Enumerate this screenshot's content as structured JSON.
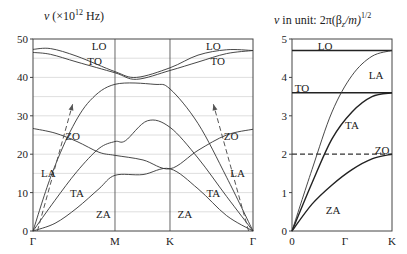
{
  "chart_data": [
    {
      "type": "line",
      "title": "ν (×10^12 Hz)",
      "title_parts": {
        "nu": "ν",
        "open": "(×10",
        "exp": "12",
        "close": " Hz)"
      },
      "xlabel": "",
      "ylabel": "ν (×10^12 Hz)",
      "ylim": [
        0,
        50
      ],
      "yticks": [
        0,
        10,
        20,
        30,
        40,
        50
      ],
      "grid": true,
      "grid_step": 5,
      "x_ticks": [
        "Γ",
        "M",
        "K",
        "Γ"
      ],
      "x_positions": [
        0,
        0.3727,
        0.6227,
        1
      ],
      "series": [
        {
          "name": "LO",
          "x": [
            0,
            0.08,
            0.2,
            0.3727,
            0.47,
            0.6227,
            0.75,
            0.88,
            1
          ],
          "values": [
            47.3,
            47.5,
            45.5,
            41.5,
            40.0,
            42.5,
            45.8,
            47.2,
            47.0
          ]
        },
        {
          "name": "TO",
          "x": [
            0,
            0.08,
            0.2,
            0.3727,
            0.47,
            0.6227,
            0.75,
            0.88,
            1
          ],
          "values": [
            46.5,
            46.0,
            44.0,
            41.2,
            39.5,
            41.8,
            44.0,
            46.2,
            47.0
          ]
        },
        {
          "name": "LA",
          "x": [
            0,
            0.08,
            0.17,
            0.26,
            0.3727,
            0.55,
            0.6227,
            0.75,
            0.88,
            1
          ],
          "values": [
            0,
            14,
            26,
            34,
            38.2,
            38.2,
            37,
            28,
            14,
            0
          ]
        },
        {
          "name": "TA",
          "x": [
            0,
            0.1,
            0.2,
            0.3,
            0.3727,
            0.42,
            0.52,
            0.6227,
            0.75,
            0.88,
            1
          ],
          "values": [
            0,
            8,
            15.5,
            21.5,
            23.3,
            23.5,
            28.7,
            27.0,
            19,
            9,
            0
          ]
        },
        {
          "name": "ZO",
          "x": [
            0,
            0.1,
            0.2,
            0.3,
            0.3727,
            0.5,
            0.6227,
            0.75,
            0.88,
            1
          ],
          "values": [
            26.7,
            25.5,
            23.3,
            20.5,
            19.7,
            18.5,
            16.2,
            21,
            25,
            26.5
          ]
        },
        {
          "name": "ZA",
          "x": [
            0,
            0.1,
            0.2,
            0.3,
            0.3727,
            0.5,
            0.6227,
            0.75,
            0.88,
            1
          ],
          "values": [
            0,
            2,
            6,
            11,
            14.5,
            14.7,
            16.2,
            11,
            4,
            0
          ]
        }
      ],
      "dashed_arrows": [
        {
          "from": [
            0.02,
            0
          ],
          "to": [
            0.18,
            33
          ]
        },
        {
          "from": [
            0.98,
            0
          ],
          "to": [
            0.82,
            33
          ]
        }
      ],
      "annotations": [
        {
          "text": "LO",
          "x": 0.3,
          "y": 48.2
        },
        {
          "text": "TO",
          "x": 0.28,
          "y": 44.3
        },
        {
          "text": "LO",
          "x": 0.82,
          "y": 48.2
        },
        {
          "text": "TO",
          "x": 0.84,
          "y": 44.3
        },
        {
          "text": "ZO",
          "x": 0.18,
          "y": 24.8
        },
        {
          "text": "ZO",
          "x": 0.9,
          "y": 24.8
        },
        {
          "text": "LA",
          "x": 0.07,
          "y": 15
        },
        {
          "text": "LA",
          "x": 0.93,
          "y": 15
        },
        {
          "text": "TA",
          "x": 0.2,
          "y": 9.8
        },
        {
          "text": "TA",
          "x": 0.82,
          "y": 9.8
        },
        {
          "text": "ZA",
          "x": 0.32,
          "y": 4.5
        },
        {
          "text": "ZA",
          "x": 0.69,
          "y": 4.5
        }
      ]
    },
    {
      "type": "line",
      "title": "ν in unit: 2π(β_z/m)^1/2",
      "title_parts": {
        "nu": "ν",
        "text": " in unit: 2π(β",
        "sub": "z",
        "mid": "/m)",
        "exp": "1/2"
      },
      "xlabel": "",
      "ylabel": "ν in unit 2π(β_z/m)^1/2",
      "ylim": [
        0,
        5
      ],
      "yticks": [
        0,
        1,
        2,
        3,
        4,
        5
      ],
      "grid": false,
      "x_ticks": [
        "0",
        "Γ",
        "K"
      ],
      "x_positions": [
        0,
        0.53,
        1
      ],
      "series": [
        {
          "name": "LO",
          "x": [
            0,
            1
          ],
          "values": [
            4.7,
            4.7
          ]
        },
        {
          "name": "TO",
          "x": [
            0,
            1
          ],
          "values": [
            3.6,
            3.6
          ]
        },
        {
          "name": "ZO",
          "x": [
            0,
            1
          ],
          "values": [
            2.0,
            2.0
          ],
          "style": "dashed"
        },
        {
          "name": "LA",
          "x": [
            0,
            0.2,
            0.4,
            0.6,
            0.8,
            1
          ],
          "values": [
            0,
            1.6,
            3.1,
            4.05,
            4.55,
            4.7
          ]
        },
        {
          "name": "TA",
          "x": [
            0,
            0.2,
            0.4,
            0.6,
            0.8,
            1
          ],
          "values": [
            0,
            1.25,
            2.4,
            3.1,
            3.5,
            3.6
          ]
        },
        {
          "name": "ZA",
          "x": [
            0,
            0.2,
            0.4,
            0.6,
            0.8,
            1
          ],
          "values": [
            0,
            0.7,
            1.2,
            1.6,
            1.88,
            2.0
          ]
        }
      ],
      "annotations": [
        {
          "text": "LO",
          "x": 0.33,
          "y": 4.82
        },
        {
          "text": "TO",
          "x": 0.1,
          "y": 3.72
        },
        {
          "text": "LA",
          "x": 0.84,
          "y": 4.05
        },
        {
          "text": "TA",
          "x": 0.6,
          "y": 2.75
        },
        {
          "text": "ZO",
          "x": 0.9,
          "y": 2.1
        },
        {
          "text": "ZA",
          "x": 0.41,
          "y": 0.55
        }
      ]
    }
  ]
}
